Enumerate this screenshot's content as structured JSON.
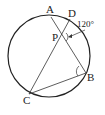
{
  "diagram": {
    "type": "circle-geometry",
    "points": {
      "A": {
        "label": "A"
      },
      "D": {
        "label": "D"
      },
      "P": {
        "label": "P"
      },
      "B": {
        "label": "B"
      },
      "C": {
        "label": "C"
      }
    },
    "angle_annotation": "120°",
    "segments": [
      "AB",
      "CD",
      "CB"
    ],
    "colors": {
      "stroke": "#222222",
      "background": "#ffffff"
    }
  }
}
